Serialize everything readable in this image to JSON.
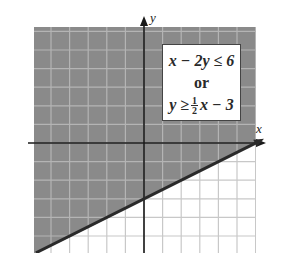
{
  "graph": {
    "x_axis_label": "x",
    "y_axis_label": "y",
    "colors": {
      "shaded": "#8a8a8a",
      "grid_on_shaded": "#b4b4b4",
      "grid_on_white": "#c8c8c8",
      "axis": "#1a1a1a",
      "boundary_line": "#2a2a2a"
    },
    "grid": {
      "x_min": -6,
      "x_max": 6,
      "y_min": -6,
      "y_max": 6,
      "step": 1
    },
    "boundary": {
      "equation": "y = (1/2)x - 3",
      "slope": 0.5,
      "y_intercept": -3,
      "style": "solid"
    },
    "shaded_region": "above boundary line"
  },
  "legend": {
    "line1": "x − 2y ≤ 6",
    "line2": "or",
    "line3_lhs": "y ≥",
    "line3_frac_num": "1",
    "line3_frac_den": "2",
    "line3_rhs": "x − 3"
  }
}
